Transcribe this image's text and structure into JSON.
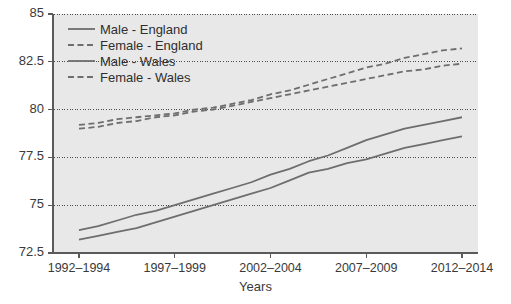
{
  "chart_data": {
    "type": "line",
    "title": "",
    "xlabel": "Years",
    "ylabel": "",
    "ylim": [
      72.5,
      85
    ],
    "yticks": [
      72.5,
      75,
      77.5,
      80,
      82.5,
      85
    ],
    "ytick_labels": [
      "72.5",
      "75",
      "77.5",
      "80",
      "82.5",
      "85"
    ],
    "grid": "horizontal-dotted",
    "legend_position": "top-left",
    "categories": [
      "1992–1994",
      "1993–1995",
      "1994–1996",
      "1995–1997",
      "1996–1998",
      "1997–1999",
      "1998–2000",
      "1999–2001",
      "2000–2002",
      "2001–2003",
      "2002–2004",
      "2003–2005",
      "2004–2006",
      "2005–2007",
      "2006–2008",
      "2007–2009",
      "2008–2010",
      "2009–2011",
      "2010–2012",
      "2011–2013",
      "2012–2014"
    ],
    "xtick_labels": [
      "1992–1994",
      "1997–1999",
      "2002–2004",
      "2007–2009",
      "2012–2014"
    ],
    "xtick_indices": [
      0,
      5,
      10,
      15,
      20
    ],
    "series": [
      {
        "name": "Male - England",
        "style": "solid",
        "color": "#6e6e6e",
        "values": [
          73.7,
          73.9,
          74.2,
          74.5,
          74.7,
          75.0,
          75.3,
          75.6,
          75.9,
          76.2,
          76.6,
          76.9,
          77.3,
          77.6,
          78.0,
          78.4,
          78.7,
          79.0,
          79.2,
          79.4,
          79.6
        ]
      },
      {
        "name": "Female - England",
        "style": "dashed",
        "color": "#6e6e6e",
        "values": [
          79.2,
          79.3,
          79.5,
          79.6,
          79.7,
          79.8,
          80.0,
          80.1,
          80.3,
          80.5,
          80.8,
          81.0,
          81.3,
          81.6,
          81.9,
          82.2,
          82.4,
          82.7,
          82.9,
          83.1,
          83.2
        ]
      },
      {
        "name": "Male - Wales",
        "style": "solid",
        "color": "#6e6e6e",
        "values": [
          73.2,
          73.4,
          73.6,
          73.8,
          74.1,
          74.4,
          74.7,
          75.0,
          75.3,
          75.6,
          75.9,
          76.3,
          76.7,
          76.9,
          77.2,
          77.4,
          77.7,
          78.0,
          78.2,
          78.4,
          78.6
        ]
      },
      {
        "name": "Female - Wales",
        "style": "dashed",
        "color": "#6e6e6e",
        "values": [
          79.0,
          79.1,
          79.3,
          79.4,
          79.6,
          79.7,
          79.9,
          80.0,
          80.2,
          80.4,
          80.6,
          80.8,
          81.0,
          81.2,
          81.4,
          81.6,
          81.8,
          82.0,
          82.1,
          82.3,
          82.4
        ]
      }
    ]
  },
  "legend": {
    "items": [
      {
        "label": "Male - England",
        "style": "solid"
      },
      {
        "label": "Female - England",
        "style": "dashed"
      },
      {
        "label": "Male - Wales",
        "style": "solid"
      },
      {
        "label": "Female - Wales",
        "style": "dashed"
      }
    ]
  },
  "colors": {
    "plot_background": "#e8e8e8",
    "line": "#6e6e6e",
    "axis": "#5a5a5a",
    "gridline": "#4a4a4a",
    "text": "#3a3a3a",
    "page_background": "#ffffff"
  }
}
